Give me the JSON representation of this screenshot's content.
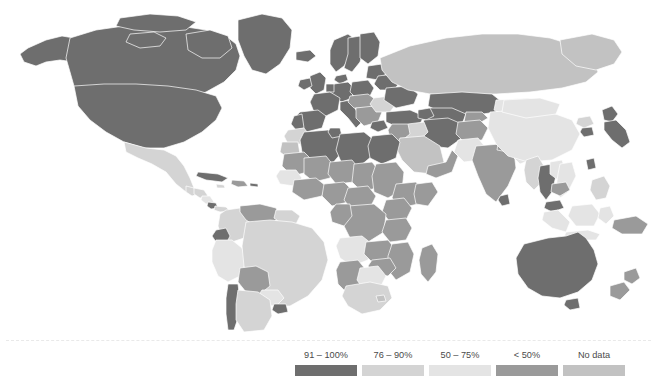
{
  "figure": {
    "type": "choropleth-world-map",
    "background_color": "#ffffff"
  },
  "legend": {
    "caption": "Proportion of the population using improved sanitation in 2010",
    "divider_color": "#e9e9e9",
    "items": [
      {
        "label": "91 – 100%",
        "color": "#6e6e6e",
        "x": 0,
        "width": 62
      },
      {
        "label": "76 – 90%",
        "color": "#d4d4d4",
        "x": 67,
        "width": 62
      },
      {
        "label": "50 – 75%",
        "color": "#e4e4e4",
        "x": 134,
        "width": 62
      },
      {
        "label": "< 50%",
        "color": "#9a9a9a",
        "x": 201,
        "width": 62
      },
      {
        "label": "No data",
        "color": "#c2c2c2",
        "x": 268,
        "width": 62
      }
    ]
  },
  "chart_data": {
    "type": "heatmap",
    "title": "",
    "subtitle": "",
    "xlabel": "",
    "ylabel": "",
    "legend_position": "bottom-right",
    "grid": false,
    "categories": [
      "91 – 100%",
      "76 – 90%",
      "50 – 75%",
      "< 50%",
      "No data"
    ],
    "category_colors": [
      "#6e6e6e",
      "#d4d4d4",
      "#e4e4e4",
      "#9a9a9a",
      "#c2c2c2"
    ],
    "measure": "Proportion of the population using improved sanitation in 2010",
    "regions": [
      {
        "name": "Canada",
        "category": "91 – 100%"
      },
      {
        "name": "United States",
        "category": "91 – 100%"
      },
      {
        "name": "Greenland",
        "category": "91 – 100%"
      },
      {
        "name": "Mexico",
        "category": "76 – 90%"
      },
      {
        "name": "Cuba",
        "category": "91 – 100%"
      },
      {
        "name": "Guatemala",
        "category": "76 – 90%"
      },
      {
        "name": "Honduras",
        "category": "76 – 90%"
      },
      {
        "name": "Nicaragua",
        "category": "50 – 75%"
      },
      {
        "name": "Costa Rica",
        "category": "91 – 100%"
      },
      {
        "name": "Panama",
        "category": "76 – 90%"
      },
      {
        "name": "Colombia",
        "category": "76 – 90%"
      },
      {
        "name": "Venezuela",
        "category": "91 – 100%"
      },
      {
        "name": "Guyana",
        "category": "76 – 90%"
      },
      {
        "name": "Suriname",
        "category": "76 – 90%"
      },
      {
        "name": "Ecuador",
        "category": "91 – 100%"
      },
      {
        "name": "Peru",
        "category": "50 – 75%"
      },
      {
        "name": "Brazil",
        "category": "76 – 90%"
      },
      {
        "name": "Bolivia",
        "category": "< 50%"
      },
      {
        "name": "Paraguay",
        "category": "50 – 75%"
      },
      {
        "name": "Uruguay",
        "category": "91 – 100%"
      },
      {
        "name": "Chile",
        "category": "91 – 100%"
      },
      {
        "name": "Argentina",
        "category": "76 – 90%"
      },
      {
        "name": "United Kingdom",
        "category": "91 – 100%"
      },
      {
        "name": "Ireland",
        "category": "91 – 100%"
      },
      {
        "name": "Norway",
        "category": "91 – 100%"
      },
      {
        "name": "Sweden",
        "category": "91 – 100%"
      },
      {
        "name": "Finland",
        "category": "91 – 100%"
      },
      {
        "name": "Denmark",
        "category": "91 – 100%"
      },
      {
        "name": "Germany",
        "category": "91 – 100%"
      },
      {
        "name": "France",
        "category": "91 – 100%"
      },
      {
        "name": "Spain",
        "category": "91 – 100%"
      },
      {
        "name": "Portugal",
        "category": "91 – 100%"
      },
      {
        "name": "Italy",
        "category": "91 – 100%"
      },
      {
        "name": "Poland",
        "category": "91 – 100%"
      },
      {
        "name": "Ukraine",
        "category": "91 – 100%"
      },
      {
        "name": "Romania",
        "category": "76 – 90%"
      },
      {
        "name": "Greece",
        "category": "91 – 100%"
      },
      {
        "name": "Turkey",
        "category": "91 – 100%"
      },
      {
        "name": "Russia",
        "category": "No data"
      },
      {
        "name": "Kazakhstan",
        "category": "91 – 100%"
      },
      {
        "name": "Uzbekistan",
        "category": "91 – 100%"
      },
      {
        "name": "Iran",
        "category": "91 – 100%"
      },
      {
        "name": "Iraq",
        "category": "76 – 90%"
      },
      {
        "name": "Saudi Arabia",
        "category": "No data"
      },
      {
        "name": "Egypt",
        "category": "91 – 100%"
      },
      {
        "name": "Libya",
        "category": "91 – 100%"
      },
      {
        "name": "Algeria",
        "category": "91 – 100%"
      },
      {
        "name": "Morocco",
        "category": "76 – 90%"
      },
      {
        "name": "Tunisia",
        "category": "91 – 100%"
      },
      {
        "name": "Mauritania",
        "category": "< 50%"
      },
      {
        "name": "Mali",
        "category": "< 50%"
      },
      {
        "name": "Niger",
        "category": "< 50%"
      },
      {
        "name": "Chad",
        "category": "< 50%"
      },
      {
        "name": "Sudan",
        "category": "< 50%"
      },
      {
        "name": "Ethiopia",
        "category": "< 50%"
      },
      {
        "name": "Somalia",
        "category": "< 50%"
      },
      {
        "name": "Kenya",
        "category": "< 50%"
      },
      {
        "name": "Nigeria",
        "category": "< 50%"
      },
      {
        "name": "Ghana",
        "category": "< 50%"
      },
      {
        "name": "Senegal",
        "category": "50 – 75%"
      },
      {
        "name": "Cameroon",
        "category": "< 50%"
      },
      {
        "name": "DR Congo",
        "category": "< 50%"
      },
      {
        "name": "Angola",
        "category": "< 50%"
      },
      {
        "name": "Zambia",
        "category": "< 50%"
      },
      {
        "name": "Tanzania",
        "category": "< 50%"
      },
      {
        "name": "Mozambique",
        "category": "< 50%"
      },
      {
        "name": "Madagascar",
        "category": "< 50%"
      },
      {
        "name": "Zimbabwe",
        "category": "< 50%"
      },
      {
        "name": "Botswana",
        "category": "50 – 75%"
      },
      {
        "name": "Namibia",
        "category": "< 50%"
      },
      {
        "name": "South Africa",
        "category": "76 – 90%"
      },
      {
        "name": "India",
        "category": "< 50%"
      },
      {
        "name": "Pakistan",
        "category": "50 – 75%"
      },
      {
        "name": "Afghanistan",
        "category": "< 50%"
      },
      {
        "name": "Nepal",
        "category": "< 50%"
      },
      {
        "name": "Bangladesh",
        "category": "50 – 75%"
      },
      {
        "name": "Sri Lanka",
        "category": "91 – 100%"
      },
      {
        "name": "China",
        "category": "50 – 75%"
      },
      {
        "name": "Mongolia",
        "category": "50 – 75%"
      },
      {
        "name": "Japan",
        "category": "91 – 100%"
      },
      {
        "name": "South Korea",
        "category": "91 – 100%"
      },
      {
        "name": "North Korea",
        "category": "76 – 90%"
      },
      {
        "name": "Myanmar",
        "category": "76 – 90%"
      },
      {
        "name": "Thailand",
        "category": "91 – 100%"
      },
      {
        "name": "Vietnam",
        "category": "50 – 75%"
      },
      {
        "name": "Cambodia",
        "category": "< 50%"
      },
      {
        "name": "Laos",
        "category": "50 – 75%"
      },
      {
        "name": "Malaysia",
        "category": "91 – 100%"
      },
      {
        "name": "Indonesia",
        "category": "50 – 75%"
      },
      {
        "name": "Philippines",
        "category": "76 – 90%"
      },
      {
        "name": "Papua New Guinea",
        "category": "< 50%"
      },
      {
        "name": "Australia",
        "category": "91 – 100%"
      },
      {
        "name": "New Zealand",
        "category": "91 – 100%"
      }
    ]
  }
}
